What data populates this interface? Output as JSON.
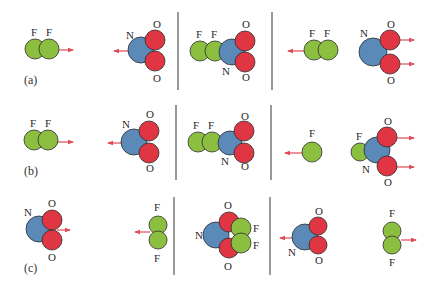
{
  "colors": {
    "F": "#8cbf3f",
    "N": "#5b8ab8",
    "O": "#e03542",
    "outline": "#2d2d2d",
    "arrow": "#e04a55",
    "divider": "#555555",
    "text": "#2a2a2a"
  },
  "panel_labels": [
    {
      "text": "(a)",
      "x": 24,
      "y": 84
    },
    {
      "text": "(b)",
      "x": 24,
      "y": 175
    },
    {
      "text": "(c)",
      "x": 24,
      "y": 272
    }
  ],
  "dividers": [
    {
      "x": 178,
      "y1": 12,
      "y2": 90
    },
    {
      "x": 272,
      "y1": 12,
      "y2": 90
    },
    {
      "x": 176,
      "y1": 105,
      "y2": 180
    },
    {
      "x": 271,
      "y1": 105,
      "y2": 180
    },
    {
      "x": 174,
      "y1": 197,
      "y2": 275
    },
    {
      "x": 270,
      "y1": 197,
      "y2": 275
    }
  ],
  "rows": [
    {
      "id": "a",
      "atoms": [
        {
          "el": "F",
          "cx": 35,
          "cy": 49,
          "r": 10
        },
        {
          "el": "F",
          "cx": 49,
          "cy": 49,
          "r": 10
        },
        {
          "el": "N",
          "cx": 141,
          "cy": 50,
          "r": 13
        },
        {
          "el": "O",
          "cx": 155,
          "cy": 40,
          "r": 10
        },
        {
          "el": "O",
          "cx": 155,
          "cy": 61,
          "r": 10
        },
        {
          "el": "F",
          "cx": 200,
          "cy": 51,
          "r": 10
        },
        {
          "el": "F",
          "cx": 215,
          "cy": 51,
          "r": 10
        },
        {
          "el": "N",
          "cx": 232,
          "cy": 52,
          "r": 13
        },
        {
          "el": "O",
          "cx": 245,
          "cy": 41,
          "r": 10
        },
        {
          "el": "O",
          "cx": 245,
          "cy": 62,
          "r": 10
        },
        {
          "el": "F",
          "cx": 314,
          "cy": 50,
          "r": 10
        },
        {
          "el": "F",
          "cx": 328,
          "cy": 50,
          "r": 10
        },
        {
          "el": "N",
          "cx": 373,
          "cy": 52,
          "r": 14
        },
        {
          "el": "O",
          "cx": 390,
          "cy": 40,
          "r": 10
        },
        {
          "el": "O",
          "cx": 390,
          "cy": 64,
          "r": 10
        }
      ],
      "labels": [
        {
          "t": "F",
          "x": 31,
          "y": 36
        },
        {
          "t": "F",
          "x": 46,
          "y": 36
        },
        {
          "t": "N",
          "x": 126,
          "y": 39
        },
        {
          "t": "O",
          "x": 153,
          "y": 28
        },
        {
          "t": "O",
          "x": 153,
          "y": 82
        },
        {
          "t": "F",
          "x": 196,
          "y": 38
        },
        {
          "t": "F",
          "x": 211,
          "y": 38
        },
        {
          "t": "N",
          "x": 222,
          "y": 75
        },
        {
          "t": "O",
          "x": 242,
          "y": 28
        },
        {
          "t": "O",
          "x": 242,
          "y": 81
        },
        {
          "t": "F",
          "x": 309,
          "y": 37
        },
        {
          "t": "F",
          "x": 324,
          "y": 37
        },
        {
          "t": "N",
          "x": 360,
          "y": 37
        },
        {
          "t": "O",
          "x": 387,
          "y": 28
        },
        {
          "t": "O",
          "x": 387,
          "y": 84
        }
      ],
      "arrows": [
        {
          "x1": 59,
          "y1": 50,
          "x2": 73,
          "y2": 50
        },
        {
          "x1": 128,
          "y1": 51,
          "x2": 114,
          "y2": 51
        },
        {
          "x1": 305,
          "y1": 51,
          "x2": 288,
          "y2": 51
        },
        {
          "x1": 400,
          "y1": 40,
          "x2": 414,
          "y2": 40
        },
        {
          "x1": 400,
          "y1": 64,
          "x2": 414,
          "y2": 64
        }
      ]
    },
    {
      "id": "b",
      "atoms": [
        {
          "el": "F",
          "cx": 34,
          "cy": 140,
          "r": 10
        },
        {
          "el": "F",
          "cx": 48,
          "cy": 140,
          "r": 10
        },
        {
          "el": "N",
          "cx": 134,
          "cy": 142,
          "r": 13
        },
        {
          "el": "O",
          "cx": 149,
          "cy": 131,
          "r": 10
        },
        {
          "el": "O",
          "cx": 149,
          "cy": 153,
          "r": 10
        },
        {
          "el": "F",
          "cx": 198,
          "cy": 142,
          "r": 10
        },
        {
          "el": "F",
          "cx": 212,
          "cy": 142,
          "r": 10
        },
        {
          "el": "N",
          "cx": 230,
          "cy": 143,
          "r": 12
        },
        {
          "el": "O",
          "cx": 244,
          "cy": 131,
          "r": 10
        },
        {
          "el": "O",
          "cx": 244,
          "cy": 153,
          "r": 10
        },
        {
          "el": "F",
          "cx": 312,
          "cy": 152,
          "r": 10
        },
        {
          "el": "F",
          "cx": 360,
          "cy": 152,
          "r": 9
        },
        {
          "el": "N",
          "cx": 377,
          "cy": 150,
          "r": 13
        },
        {
          "el": "O",
          "cx": 387,
          "cy": 137,
          "r": 10
        },
        {
          "el": "O",
          "cx": 387,
          "cy": 166,
          "r": 10
        }
      ],
      "labels": [
        {
          "t": "F",
          "x": 30,
          "y": 127
        },
        {
          "t": "F",
          "x": 45,
          "y": 127
        },
        {
          "t": "N",
          "x": 122,
          "y": 128
        },
        {
          "t": "O",
          "x": 146,
          "y": 118
        },
        {
          "t": "O",
          "x": 146,
          "y": 172
        },
        {
          "t": "F",
          "x": 193,
          "y": 129
        },
        {
          "t": "F",
          "x": 208,
          "y": 129
        },
        {
          "t": "N",
          "x": 221,
          "y": 165
        },
        {
          "t": "O",
          "x": 241,
          "y": 120
        },
        {
          "t": "O",
          "x": 241,
          "y": 170
        },
        {
          "t": "F",
          "x": 309,
          "y": 137
        },
        {
          "t": "F",
          "x": 356,
          "y": 140
        },
        {
          "t": "N",
          "x": 362,
          "y": 173
        },
        {
          "t": "O",
          "x": 384,
          "y": 125
        },
        {
          "t": "O",
          "x": 384,
          "y": 186
        }
      ],
      "arrows": [
        {
          "x1": 57,
          "y1": 142,
          "x2": 73,
          "y2": 142
        },
        {
          "x1": 122,
          "y1": 143,
          "x2": 108,
          "y2": 143
        },
        {
          "x1": 302,
          "y1": 153,
          "x2": 285,
          "y2": 153
        },
        {
          "x1": 397,
          "y1": 138,
          "x2": 414,
          "y2": 138
        },
        {
          "x1": 397,
          "y1": 167,
          "x2": 414,
          "y2": 167
        }
      ]
    },
    {
      "id": "c",
      "atoms": [
        {
          "el": "N",
          "cx": 39,
          "cy": 229,
          "r": 13
        },
        {
          "el": "O",
          "cx": 52,
          "cy": 220,
          "r": 10
        },
        {
          "el": "O",
          "cx": 52,
          "cy": 240,
          "r": 10
        },
        {
          "el": "F",
          "cx": 158,
          "cy": 225,
          "r": 9
        },
        {
          "el": "F",
          "cx": 158,
          "cy": 240,
          "r": 9
        },
        {
          "el": "N",
          "cx": 216,
          "cy": 235,
          "r": 13
        },
        {
          "el": "O",
          "cx": 229,
          "cy": 222,
          "r": 10
        },
        {
          "el": "O",
          "cx": 229,
          "cy": 248,
          "r": 10
        },
        {
          "el": "F",
          "cx": 241,
          "cy": 228,
          "r": 10
        },
        {
          "el": "F",
          "cx": 241,
          "cy": 243,
          "r": 10
        },
        {
          "el": "N",
          "cx": 305,
          "cy": 237,
          "r": 13
        },
        {
          "el": "O",
          "cx": 318,
          "cy": 226,
          "r": 9
        },
        {
          "el": "O",
          "cx": 318,
          "cy": 245,
          "r": 9
        },
        {
          "el": "F",
          "cx": 392,
          "cy": 231,
          "r": 9
        },
        {
          "el": "F",
          "cx": 392,
          "cy": 245,
          "r": 9
        }
      ],
      "labels": [
        {
          "t": "N",
          "x": 24,
          "y": 216
        },
        {
          "t": "O",
          "x": 48,
          "y": 207
        },
        {
          "t": "O",
          "x": 48,
          "y": 261
        },
        {
          "t": "F",
          "x": 154,
          "y": 211
        },
        {
          "t": "F",
          "x": 154,
          "y": 262
        },
        {
          "t": "N",
          "x": 195,
          "y": 239
        },
        {
          "t": "O",
          "x": 224,
          "y": 209
        },
        {
          "t": "O",
          "x": 224,
          "y": 270
        },
        {
          "t": "F",
          "x": 253,
          "y": 232
        },
        {
          "t": "F",
          "x": 253,
          "y": 249
        },
        {
          "t": "N",
          "x": 288,
          "y": 256
        },
        {
          "t": "O",
          "x": 315,
          "y": 215
        },
        {
          "t": "O",
          "x": 315,
          "y": 264
        },
        {
          "t": "F",
          "x": 389,
          "y": 217
        },
        {
          "t": "F",
          "x": 389,
          "y": 266
        }
      ],
      "arrows": [
        {
          "x1": 57,
          "y1": 230,
          "x2": 70,
          "y2": 230
        },
        {
          "x1": 150,
          "y1": 232,
          "x2": 135,
          "y2": 232
        },
        {
          "x1": 296,
          "y1": 238,
          "x2": 280,
          "y2": 238
        },
        {
          "x1": 401,
          "y1": 240,
          "x2": 416,
          "y2": 240
        }
      ]
    }
  ]
}
